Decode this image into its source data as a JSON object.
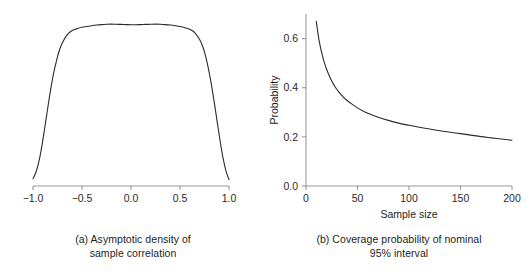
{
  "figure": {
    "panels": [
      {
        "id": "panel-a",
        "caption_line1": "(a) Asymptotic density of",
        "caption_line2": "sample correlation"
      },
      {
        "id": "panel-b",
        "caption_line1": "(b) Coverage probability of nominal",
        "caption_line2": "95% interval"
      }
    ]
  },
  "chart_data": [
    {
      "type": "line",
      "id": "asymptotic-density",
      "title": "(a) Asymptotic density of sample correlation",
      "xlabel": "",
      "ylabel": "",
      "xlim": [
        -1.0,
        1.0
      ],
      "ylim": [
        0.0,
        1.05
      ],
      "grid": false,
      "legend": "none",
      "xticks": [
        -1.0,
        -0.5,
        0.0,
        0.5,
        1.0
      ],
      "xticklabels": [
        "-1.0",
        "-0.5",
        "0.0",
        "0.5",
        "1.0"
      ],
      "yticks": [],
      "yticklabels": [],
      "x": [
        -1.0,
        -0.97,
        -0.94,
        -0.91,
        -0.88,
        -0.85,
        -0.82,
        -0.79,
        -0.76,
        -0.73,
        -0.7,
        -0.65,
        -0.6,
        -0.55,
        -0.5,
        -0.45,
        -0.4,
        -0.35,
        -0.3,
        -0.25,
        -0.2,
        -0.15,
        -0.1,
        -0.05,
        0.0,
        0.05,
        0.1,
        0.15,
        0.2,
        0.25,
        0.3,
        0.35,
        0.4,
        0.45,
        0.5,
        0.55,
        0.6,
        0.65,
        0.7,
        0.73,
        0.76,
        0.79,
        0.82,
        0.85,
        0.88,
        0.91,
        0.94,
        0.97,
        1.0
      ],
      "y": [
        0.045,
        0.085,
        0.15,
        0.245,
        0.36,
        0.48,
        0.595,
        0.695,
        0.775,
        0.84,
        0.885,
        0.935,
        0.96,
        0.972,
        0.98,
        0.985,
        0.99,
        0.994,
        0.997,
        0.999,
        1.0,
        0.999,
        0.998,
        0.997,
        0.996,
        0.996,
        0.997,
        0.998,
        0.999,
        1.0,
        0.999,
        0.997,
        0.994,
        0.99,
        0.985,
        0.978,
        0.968,
        0.948,
        0.905,
        0.865,
        0.805,
        0.725,
        0.628,
        0.515,
        0.395,
        0.275,
        0.17,
        0.09,
        0.04
      ]
    },
    {
      "type": "line",
      "id": "coverage-probability",
      "title": "(b) Coverage probability of nominal 95% interval",
      "xlabel": "Sample size",
      "ylabel": "Probability",
      "xlim": [
        0,
        200
      ],
      "ylim": [
        0.0,
        0.7
      ],
      "grid": false,
      "legend": "none",
      "xticks": [
        0,
        50,
        100,
        150,
        200
      ],
      "xticklabels": [
        "0",
        "50",
        "100",
        "150",
        "200"
      ],
      "yticks": [
        0.0,
        0.2,
        0.4,
        0.6
      ],
      "yticklabels": [
        "0.0",
        "0.2",
        "0.4",
        "0.6"
      ],
      "x": [
        10,
        12,
        14,
        16,
        18,
        20,
        24,
        28,
        32,
        36,
        40,
        45,
        50,
        55,
        60,
        70,
        80,
        90,
        100,
        110,
        120,
        130,
        140,
        150,
        160,
        170,
        180,
        190,
        200
      ],
      "y": [
        0.67,
        0.61,
        0.565,
        0.53,
        0.5,
        0.475,
        0.435,
        0.405,
        0.382,
        0.363,
        0.348,
        0.332,
        0.318,
        0.306,
        0.296,
        0.28,
        0.267,
        0.256,
        0.247,
        0.239,
        0.232,
        0.225,
        0.219,
        0.213,
        0.207,
        0.201,
        0.196,
        0.191,
        0.186
      ]
    }
  ],
  "colors": {
    "curve": "#2b2b2b",
    "axis": "#9a9a9a",
    "text": "#1d1d1d",
    "background": "#ffffff"
  }
}
